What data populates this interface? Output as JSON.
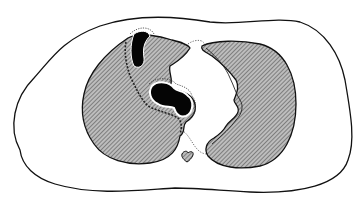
{
  "diagram": {
    "type": "axial-chest-cross-section",
    "background": "#ffffff",
    "colors": {
      "outline": "#111111",
      "lung_fill": "#b9b9b9",
      "hatch": "#4a4a4a",
      "lesion": "#050505",
      "dotted": "#444444"
    },
    "regions": [
      {
        "id": "body-outline",
        "label": ""
      },
      {
        "id": "left-lung",
        "label": ""
      },
      {
        "id": "right-lung",
        "label": ""
      },
      {
        "id": "cavity-lesion-upper",
        "label": ""
      },
      {
        "id": "cavity-lesion-hilar",
        "label": ""
      },
      {
        "id": "mediastinum-dotted-boundary",
        "label": ""
      },
      {
        "id": "aorta",
        "label": ""
      }
    ],
    "text_labels": []
  }
}
